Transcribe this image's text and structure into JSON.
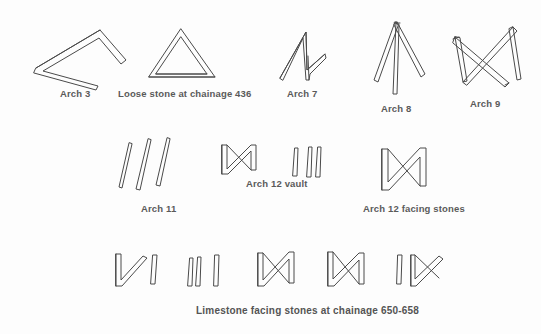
{
  "figure": {
    "background_color": "#fdfdfd",
    "stroke_color": "#4a4a4a",
    "text_color": "#545454",
    "rows": [
      {
        "row_name": "top-row",
        "marks": [
          {
            "id": "arch-3",
            "label": "Arch 3",
            "shape": "open-chevron-arrow",
            "label_x": 60,
            "label_y": 88
          },
          {
            "id": "loose-stone-436",
            "label": "Loose stone at chainage 436",
            "shape": "triangle-outline",
            "label_x": 118,
            "label_y": 88
          },
          {
            "id": "arch-7",
            "label": "Arch 7",
            "shape": "zigzag-n-slanted",
            "label_x": 287,
            "label_y": 88
          },
          {
            "id": "arch-8",
            "label": "Arch 8",
            "shape": "three-prong-fan",
            "label_x": 381,
            "label_y": 103
          },
          {
            "id": "arch-9",
            "label": "Arch 9",
            "shape": "bowtie-butterfly",
            "label_x": 470,
            "label_y": 98
          }
        ]
      },
      {
        "row_name": "middle-row",
        "marks": [
          {
            "id": "arch-11",
            "label": "Arch 11",
            "shape": "three-slanted-strokes",
            "label_x": 141,
            "label_y": 203
          },
          {
            "id": "arch-12-vault",
            "label": "Arch 12 vault",
            "shape": "letter-n-outline",
            "label_x": 246,
            "label_y": 178
          },
          {
            "id": "arch-12-facing-stones",
            "label": "Arch 12 facing stones",
            "shape": "letter-n-wide-outline",
            "label_x": 363,
            "label_y": 203
          }
        ]
      },
      {
        "row_name": "bottom-row",
        "marks": [
          {
            "id": "limestone-mark-1",
            "label": "",
            "shape": "n-with-slash"
          },
          {
            "id": "limestone-mark-2",
            "label": "",
            "shape": "three-vertical-strokes"
          },
          {
            "id": "limestone-mark-3",
            "label": "",
            "shape": "letter-n-outline"
          },
          {
            "id": "limestone-mark-4",
            "label": "",
            "shape": "letter-n-outline"
          },
          {
            "id": "limestone-mark-5",
            "label": "",
            "shape": "n-with-slash"
          }
        ],
        "caption": "Limestone facing stones at chainage 650-658",
        "caption_x": 196,
        "caption_y": 305
      }
    ]
  }
}
